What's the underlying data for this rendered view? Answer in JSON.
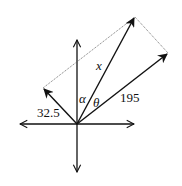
{
  "diagram": {
    "labels": {
      "left_vector": "32.5",
      "right_vector": "195",
      "resultant": "x",
      "angle_alpha": "α",
      "angle_theta": "θ"
    },
    "colors": {
      "stroke": "#111111",
      "dotted": "#555555",
      "background": "#ffffff"
    }
  }
}
